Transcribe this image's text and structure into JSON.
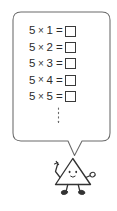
{
  "canvas": {
    "width": 117,
    "height": 211,
    "background": "#ffffff"
  },
  "colors": {
    "ink": "#2b2b2b",
    "outline": "#555555",
    "bubble_fill": "#ffffff",
    "character_outline": "#333333"
  },
  "speech_bubble": {
    "label": "speech bubble containing the five times table",
    "shape": "rounded-rectangle-with-tail",
    "equations": [
      {
        "factor_a": "5",
        "operator": "×",
        "factor_b": "1",
        "equals": "=",
        "answer": ""
      },
      {
        "factor_a": "5",
        "operator": "×",
        "factor_b": "2",
        "equals": "=",
        "answer": ""
      },
      {
        "factor_a": "5",
        "operator": "×",
        "factor_b": "3",
        "equals": "=",
        "answer": ""
      },
      {
        "factor_a": "5",
        "operator": "×",
        "factor_b": "4",
        "equals": "=",
        "answer": ""
      },
      {
        "factor_a": "5",
        "operator": "×",
        "factor_b": "5",
        "equals": "=",
        "answer": ""
      }
    ],
    "continuation": {
      "label": "vertical dotted line indicating the sequence continues",
      "glyph": "⋮"
    }
  },
  "character": {
    "label": "smiling triangle character",
    "shape": "triangle",
    "expression": "smiling",
    "eyes": 2,
    "arms": 2,
    "legs": 2
  }
}
